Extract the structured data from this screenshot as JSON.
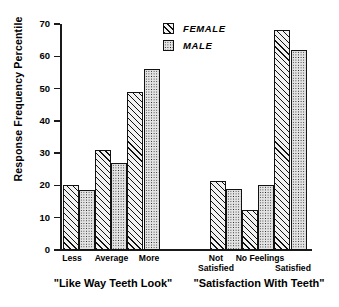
{
  "chart_data": {
    "type": "bar",
    "title": "",
    "xlabel": "",
    "ylabel": "Response Frequency Percentile",
    "ylim": [
      0,
      70
    ],
    "yticks": [
      0,
      10,
      20,
      30,
      40,
      50,
      60,
      70
    ],
    "ytick_labels": [
      "0",
      "10",
      "20",
      "30",
      "40",
      "50",
      "60",
      "70"
    ],
    "grid": false,
    "legend_position": "top-center",
    "legend": [
      "FEMALE",
      "MALE"
    ],
    "series": [
      {
        "name": "FEMALE",
        "pattern": "diagonal-hatch",
        "values": [
          20,
          31,
          49,
          21.5,
          12.5,
          68
        ]
      },
      {
        "name": "MALE",
        "pattern": "stipple-dots",
        "values": [
          18.5,
          27,
          56,
          19,
          20,
          62
        ]
      }
    ],
    "panels": [
      {
        "title": "\"Like Way Teeth Look\"",
        "categories": [
          "Less",
          "Average",
          "More"
        ],
        "series": [
          {
            "name": "FEMALE",
            "values": [
              20,
              31,
              49
            ]
          },
          {
            "name": "MALE",
            "values": [
              18.5,
              27,
              56
            ]
          }
        ]
      },
      {
        "title": "\"Satisfaction With Teeth\"",
        "categories": [
          "Not Satisfied",
          "No Feelings",
          "Satisfied"
        ],
        "series": [
          {
            "name": "FEMALE",
            "values": [
              21.5,
              12.5,
              68
            ]
          },
          {
            "name": "MALE",
            "values": [
              19,
              20,
              62
            ]
          }
        ]
      }
    ]
  },
  "axis": {
    "y_title": "Response Frequency Percentile",
    "ticks": [
      "70",
      "60",
      "50",
      "40",
      "30",
      "20",
      "10",
      "0"
    ]
  },
  "legend": {
    "items": [
      {
        "label": "FEMALE",
        "pattern": "diagonal-hatch"
      },
      {
        "label": "MALE",
        "pattern": "stipple-dots"
      }
    ]
  },
  "panel_left": {
    "caption": "\"Like Way Teeth Look\"",
    "cat1": "Less",
    "cat2": "Average",
    "cat3": "More",
    "bars": [
      {
        "name": "less-female",
        "value": 20,
        "series": "FEMALE"
      },
      {
        "name": "less-male",
        "value": 18.5,
        "series": "MALE"
      },
      {
        "name": "average-female",
        "value": 31,
        "series": "FEMALE"
      },
      {
        "name": "average-male",
        "value": 27,
        "series": "MALE"
      },
      {
        "name": "more-female",
        "value": 49,
        "series": "FEMALE"
      },
      {
        "name": "more-male",
        "value": 56,
        "series": "MALE"
      }
    ]
  },
  "panel_right": {
    "caption": "\"Satisfaction With Teeth\"",
    "cat1_line1": "Not",
    "cat1_line2": "Satisfied",
    "cat2": "No Feelings",
    "cat3": "Satisfied",
    "bars": [
      {
        "name": "not-satisfied-female",
        "value": 21.5,
        "series": "FEMALE"
      },
      {
        "name": "not-satisfied-male",
        "value": 19,
        "series": "MALE"
      },
      {
        "name": "no-feelings-female",
        "value": 12.5,
        "series": "FEMALE"
      },
      {
        "name": "no-feelings-male",
        "value": 20,
        "series": "MALE"
      },
      {
        "name": "satisfied-female",
        "value": 68,
        "series": "FEMALE"
      },
      {
        "name": "satisfied-male",
        "value": 62,
        "series": "MALE"
      }
    ]
  },
  "colors": {
    "ink": "#111111",
    "female_fill": "#f2f2f2",
    "male_fill": "#e3e3e3",
    "background": "#ffffff"
  }
}
